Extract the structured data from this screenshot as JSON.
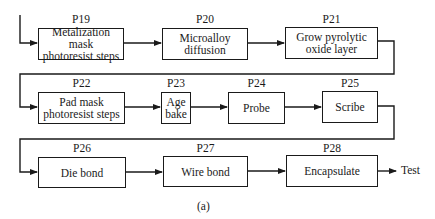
{
  "diagram": {
    "caption": "(a)",
    "output_label": "Test",
    "steps": [
      {
        "id": "P19",
        "text": "Metalization mask photoresist steps",
        "line1": "Metalization mask",
        "line2": "photoresist steps"
      },
      {
        "id": "P20",
        "text": "Microalloy diffusion",
        "line1": "Microalloy",
        "line2": "diffusion"
      },
      {
        "id": "P21",
        "text": "Grow pyrolytic oxide layer",
        "line1": "Grow pyrolytic",
        "line2": "oxide layer"
      },
      {
        "id": "P22",
        "text": "Pad mask photoresist steps",
        "line1": "Pad mask",
        "line2": "photoresist steps"
      },
      {
        "id": "P23",
        "text": "Age bake",
        "line1": "Age",
        "line2": "bake"
      },
      {
        "id": "P24",
        "text": "Probe",
        "line1": "Probe",
        "line2": ""
      },
      {
        "id": "P25",
        "text": "Scribe",
        "line1": "Scribe",
        "line2": ""
      },
      {
        "id": "P26",
        "text": "Die bond",
        "line1": "Die bond",
        "line2": ""
      },
      {
        "id": "P27",
        "text": "Wire bond",
        "line1": "Wire bond",
        "line2": ""
      },
      {
        "id": "P28",
        "text": "Encapsulate",
        "line1": "Encapsulate",
        "line2": ""
      }
    ],
    "flow": [
      "P19",
      "P20",
      "P21",
      "P22",
      "P23",
      "P24",
      "P25",
      "P26",
      "P27",
      "P28",
      "Test"
    ]
  }
}
